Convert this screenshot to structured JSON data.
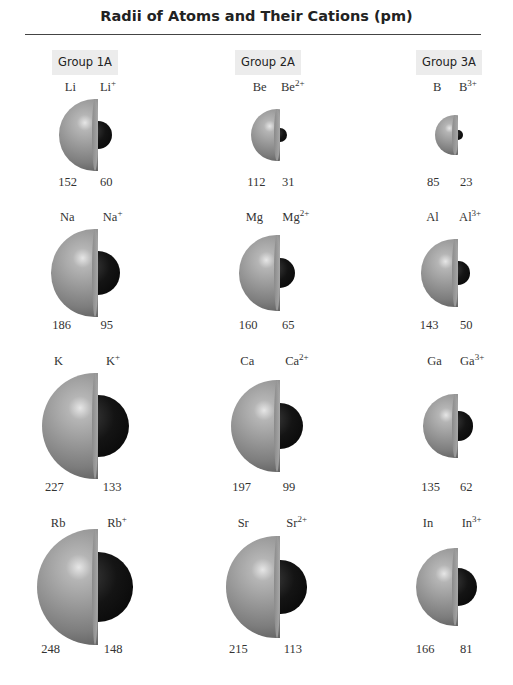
{
  "title": "Radii of Atoms and Their Cations (pm)",
  "groups": [
    {
      "label": "Group 1A"
    },
    {
      "label": "Group 2A"
    },
    {
      "label": "Group 3A"
    }
  ],
  "colors": {
    "atom": "#9a9a9a",
    "cation": "#0a0a0a",
    "label_bg": "#ececec"
  },
  "chart_data": {
    "type": "table",
    "title": "Radii of Atoms and Their Cations (pm)",
    "columns": [
      "Group 1A",
      "Group 2A",
      "Group 3A"
    ],
    "units": "pm",
    "rows": [
      [
        {
          "atom": "Li",
          "cation": "Li+",
          "atom_radius": 152,
          "cation_radius": 60
        },
        {
          "atom": "Be",
          "cation": "Be2+",
          "atom_radius": 112,
          "cation_radius": 31
        },
        {
          "atom": "B",
          "cation": "B3+",
          "atom_radius": 85,
          "cation_radius": 23
        }
      ],
      [
        {
          "atom": "Na",
          "cation": "Na+",
          "atom_radius": 186,
          "cation_radius": 95
        },
        {
          "atom": "Mg",
          "cation": "Mg2+",
          "atom_radius": 160,
          "cation_radius": 65
        },
        {
          "atom": "Al",
          "cation": "Al3+",
          "atom_radius": 143,
          "cation_radius": 50
        }
      ],
      [
        {
          "atom": "K",
          "cation": "K+",
          "atom_radius": 227,
          "cation_radius": 133
        },
        {
          "atom": "Ca",
          "cation": "Ca2+",
          "atom_radius": 197,
          "cation_radius": 99
        },
        {
          "atom": "Ga",
          "cation": "Ga3+",
          "atom_radius": 135,
          "cation_radius": 62
        }
      ],
      [
        {
          "atom": "Rb",
          "cation": "Rb+",
          "atom_radius": 248,
          "cation_radius": 148
        },
        {
          "atom": "Sr",
          "cation": "Sr2+",
          "atom_radius": 215,
          "cation_radius": 113
        },
        {
          "atom": "In",
          "cation": "In3+",
          "atom_radius": 166,
          "cation_radius": 81
        }
      ]
    ]
  },
  "cells": [
    {
      "sym": "Li",
      "ion": "Li",
      "charge": "+",
      "a": "152",
      "c": "60"
    },
    {
      "sym": "Be",
      "ion": "Be",
      "charge": "2+",
      "a": "112",
      "c": "31"
    },
    {
      "sym": "B",
      "ion": "B",
      "charge": "3+",
      "a": "85",
      "c": "23"
    },
    {
      "sym": "Na",
      "ion": "Na",
      "charge": "+",
      "a": "186",
      "c": "95"
    },
    {
      "sym": "Mg",
      "ion": "Mg",
      "charge": "2+",
      "a": "160",
      "c": "65"
    },
    {
      "sym": "Al",
      "ion": "Al",
      "charge": "3+",
      "a": "143",
      "c": "50"
    },
    {
      "sym": "K",
      "ion": "K",
      "charge": "+",
      "a": "227",
      "c": "133"
    },
    {
      "sym": "Ca",
      "ion": "Ca",
      "charge": "2+",
      "a": "197",
      "c": "99"
    },
    {
      "sym": "Ga",
      "ion": "Ga",
      "charge": "3+",
      "a": "135",
      "c": "62"
    },
    {
      "sym": "Rb",
      "ion": "Rb",
      "charge": "+",
      "a": "248",
      "c": "148"
    },
    {
      "sym": "Sr",
      "ion": "Sr",
      "charge": "2+",
      "a": "215",
      "c": "113"
    },
    {
      "sym": "In",
      "ion": "In",
      "charge": "3+",
      "a": "166",
      "c": "81"
    }
  ]
}
